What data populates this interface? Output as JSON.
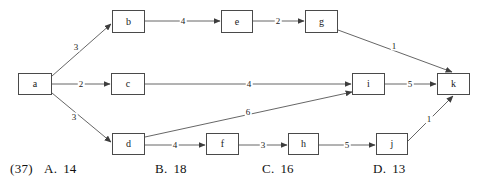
{
  "diagram": {
    "type": "directed-weighted-graph",
    "nodes": [
      {
        "id": "a",
        "label": "a",
        "x": 18,
        "y": 73,
        "w": 34,
        "h": 22
      },
      {
        "id": "b",
        "label": "b",
        "x": 112,
        "y": 10,
        "w": 33,
        "h": 23
      },
      {
        "id": "c",
        "label": "c",
        "x": 111,
        "y": 73,
        "w": 34,
        "h": 22
      },
      {
        "id": "d",
        "label": "d",
        "x": 112,
        "y": 133,
        "w": 33,
        "h": 22
      },
      {
        "id": "e",
        "label": "e",
        "x": 221,
        "y": 10,
        "w": 32,
        "h": 23
      },
      {
        "id": "f",
        "label": "f",
        "x": 206,
        "y": 133,
        "w": 33,
        "h": 22
      },
      {
        "id": "g",
        "label": "g",
        "x": 305,
        "y": 10,
        "w": 33,
        "h": 23
      },
      {
        "id": "h",
        "label": "h",
        "x": 288,
        "y": 133,
        "w": 31,
        "h": 22
      },
      {
        "id": "i",
        "label": "i",
        "x": 352,
        "y": 73,
        "w": 33,
        "h": 22
      },
      {
        "id": "j",
        "label": "j",
        "x": 376,
        "y": 133,
        "w": 32,
        "h": 22
      },
      {
        "id": "k",
        "label": "k",
        "x": 437,
        "y": 73,
        "w": 33,
        "h": 22
      }
    ],
    "edges": [
      {
        "from": "a",
        "to": "b",
        "weight": "3",
        "x1": 52,
        "y1": 76,
        "x2": 111,
        "y2": 24,
        "lx": 76,
        "ly": 47
      },
      {
        "from": "a",
        "to": "c",
        "weight": "2",
        "x1": 52,
        "y1": 84,
        "x2": 110,
        "y2": 84,
        "lx": 81,
        "ly": 84
      },
      {
        "from": "a",
        "to": "d",
        "weight": "3",
        "x1": 52,
        "y1": 93,
        "x2": 111,
        "y2": 142,
        "lx": 74,
        "ly": 117
      },
      {
        "from": "b",
        "to": "e",
        "weight": "4",
        "x1": 145,
        "y1": 21,
        "x2": 220,
        "y2": 21,
        "lx": 183,
        "ly": 21
      },
      {
        "from": "e",
        "to": "g",
        "weight": "2",
        "x1": 253,
        "y1": 21,
        "x2": 304,
        "y2": 21,
        "lx": 278,
        "ly": 21
      },
      {
        "from": "g",
        "to": "k",
        "weight": "1",
        "x1": 338,
        "y1": 30,
        "x2": 452,
        "y2": 72,
        "lx": 394,
        "ly": 46
      },
      {
        "from": "c",
        "to": "i",
        "weight": "4",
        "x1": 145,
        "y1": 84,
        "x2": 351,
        "y2": 84,
        "lx": 249,
        "ly": 84
      },
      {
        "from": "d",
        "to": "i",
        "weight": "6",
        "x1": 145,
        "y1": 137,
        "x2": 352,
        "y2": 92,
        "lx": 248,
        "ly": 112
      },
      {
        "from": "d",
        "to": "f",
        "weight": "4",
        "x1": 145,
        "y1": 145,
        "x2": 205,
        "y2": 145,
        "lx": 175,
        "ly": 145
      },
      {
        "from": "f",
        "to": "h",
        "weight": "3",
        "x1": 239,
        "y1": 145,
        "x2": 287,
        "y2": 145,
        "lx": 263,
        "ly": 145
      },
      {
        "from": "h",
        "to": "j",
        "weight": "5",
        "x1": 319,
        "y1": 145,
        "x2": 375,
        "y2": 145,
        "lx": 347,
        "ly": 145
      },
      {
        "from": "j",
        "to": "k",
        "weight": "1",
        "x1": 408,
        "y1": 141,
        "x2": 453,
        "y2": 96,
        "lx": 429,
        "ly": 119
      },
      {
        "from": "i",
        "to": "k",
        "weight": "5",
        "x1": 385,
        "y1": 84,
        "x2": 436,
        "y2": 84,
        "lx": 410,
        "ly": 84
      }
    ]
  },
  "question": {
    "number": "(37)",
    "options": [
      {
        "label": "A.",
        "value": "14",
        "x": 44
      },
      {
        "label": "B.",
        "value": "18",
        "x": 155
      },
      {
        "label": "C.",
        "value": "16",
        "x": 262
      },
      {
        "label": "D.",
        "value": "13",
        "x": 373
      }
    ]
  },
  "colors": {
    "stroke": "#4a4a4a",
    "edge": "#555555",
    "text": "#111111",
    "background": "#ffffff"
  }
}
